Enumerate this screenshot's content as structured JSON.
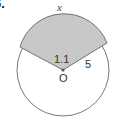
{
  "problem": {
    "number_label": "6."
  },
  "figure": {
    "arc_label": "x",
    "angle_label": "1.1",
    "radius_label": "5",
    "center_label": "O",
    "colors": {
      "sector_fill": "#c8c8c8",
      "stroke": "#555555",
      "background": "#ffffff"
    }
  }
}
